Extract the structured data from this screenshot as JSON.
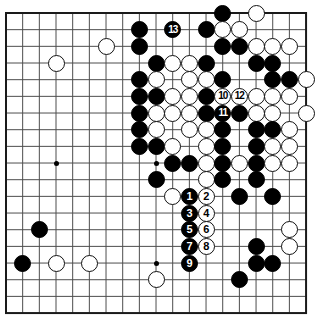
{
  "figure": {
    "kind": "go-board-diagram",
    "title": "",
    "board_size": 19,
    "colors": {
      "background": "#ffffff",
      "grid_line": "#4d4d4d",
      "border_line": "#1a1a1a",
      "black_stone": "#000000",
      "white_stone": "#ffffff",
      "white_stone_outline": "#111111"
    }
  },
  "geometry": {
    "origin_x": 6,
    "origin_y": 13,
    "spacing": 16.67,
    "stone_diameter": 17,
    "border_width": 2
  },
  "hoshi": [
    {
      "col": 3,
      "row": 3
    },
    {
      "col": 9,
      "row": 3
    },
    {
      "col": 15,
      "row": 3
    },
    {
      "col": 3,
      "row": 9
    },
    {
      "col": 9,
      "row": 9
    },
    {
      "col": 15,
      "row": 9
    },
    {
      "col": 3,
      "row": 15
    },
    {
      "col": 9,
      "row": 15
    },
    {
      "col": 15,
      "row": 15
    }
  ],
  "stones": [
    {
      "col": 13,
      "row": 0,
      "color": "black",
      "label": ""
    },
    {
      "col": 15,
      "row": 0,
      "color": "white",
      "label": ""
    },
    {
      "col": 8,
      "row": 1,
      "color": "black",
      "label": ""
    },
    {
      "col": 10,
      "row": 1,
      "color": "black",
      "label": "13"
    },
    {
      "col": 12,
      "row": 1,
      "color": "black",
      "label": ""
    },
    {
      "col": 13,
      "row": 1,
      "color": "white",
      "label": ""
    },
    {
      "col": 14,
      "row": 1,
      "color": "white",
      "label": ""
    },
    {
      "col": 6,
      "row": 2,
      "color": "white",
      "label": ""
    },
    {
      "col": 8,
      "row": 2,
      "color": "black",
      "label": ""
    },
    {
      "col": 13,
      "row": 2,
      "color": "black",
      "label": ""
    },
    {
      "col": 14,
      "row": 2,
      "color": "black",
      "label": ""
    },
    {
      "col": 15,
      "row": 2,
      "color": "white",
      "label": ""
    },
    {
      "col": 16,
      "row": 2,
      "color": "white",
      "label": ""
    },
    {
      "col": 17,
      "row": 2,
      "color": "white",
      "label": ""
    },
    {
      "col": 3,
      "row": 3,
      "color": "white",
      "label": ""
    },
    {
      "col": 9,
      "row": 3,
      "color": "black",
      "label": ""
    },
    {
      "col": 10,
      "row": 3,
      "color": "white",
      "label": ""
    },
    {
      "col": 11,
      "row": 3,
      "color": "white",
      "label": ""
    },
    {
      "col": 12,
      "row": 3,
      "color": "black",
      "label": ""
    },
    {
      "col": 15,
      "row": 3,
      "color": "black",
      "label": ""
    },
    {
      "col": 16,
      "row": 3,
      "color": "black",
      "label": ""
    },
    {
      "col": 8,
      "row": 4,
      "color": "black",
      "label": ""
    },
    {
      "col": 9,
      "row": 4,
      "color": "white",
      "label": ""
    },
    {
      "col": 11,
      "row": 4,
      "color": "white",
      "label": ""
    },
    {
      "col": 12,
      "row": 4,
      "color": "white",
      "label": ""
    },
    {
      "col": 13,
      "row": 4,
      "color": "black",
      "label": ""
    },
    {
      "col": 16,
      "row": 4,
      "color": "black",
      "label": ""
    },
    {
      "col": 17,
      "row": 4,
      "color": "black",
      "label": ""
    },
    {
      "col": 18,
      "row": 4,
      "color": "white",
      "label": ""
    },
    {
      "col": 8,
      "row": 5,
      "color": "black",
      "label": ""
    },
    {
      "col": 9,
      "row": 5,
      "color": "black",
      "label": ""
    },
    {
      "col": 10,
      "row": 5,
      "color": "white",
      "label": ""
    },
    {
      "col": 11,
      "row": 5,
      "color": "white",
      "label": ""
    },
    {
      "col": 12,
      "row": 5,
      "color": "black",
      "label": ""
    },
    {
      "col": 13,
      "row": 5,
      "color": "white",
      "label": "10"
    },
    {
      "col": 14,
      "row": 5,
      "color": "white",
      "label": "12"
    },
    {
      "col": 15,
      "row": 5,
      "color": "white",
      "label": ""
    },
    {
      "col": 16,
      "row": 5,
      "color": "white",
      "label": ""
    },
    {
      "col": 17,
      "row": 5,
      "color": "white",
      "label": ""
    },
    {
      "col": 8,
      "row": 6,
      "color": "black",
      "label": ""
    },
    {
      "col": 9,
      "row": 6,
      "color": "white",
      "label": ""
    },
    {
      "col": 10,
      "row": 6,
      "color": "white",
      "label": ""
    },
    {
      "col": 11,
      "row": 6,
      "color": "white",
      "label": ""
    },
    {
      "col": 12,
      "row": 6,
      "color": "black",
      "label": ""
    },
    {
      "col": 13,
      "row": 6,
      "color": "black",
      "label": "11"
    },
    {
      "col": 14,
      "row": 6,
      "color": "black",
      "label": ""
    },
    {
      "col": 15,
      "row": 6,
      "color": "white",
      "label": ""
    },
    {
      "col": 16,
      "row": 6,
      "color": "white",
      "label": ""
    },
    {
      "col": 18,
      "row": 6,
      "color": "white",
      "label": ""
    },
    {
      "col": 8,
      "row": 7,
      "color": "black",
      "label": ""
    },
    {
      "col": 9,
      "row": 7,
      "color": "white",
      "label": ""
    },
    {
      "col": 11,
      "row": 7,
      "color": "white",
      "label": ""
    },
    {
      "col": 12,
      "row": 7,
      "color": "white",
      "label": ""
    },
    {
      "col": 13,
      "row": 7,
      "color": "black",
      "label": ""
    },
    {
      "col": 15,
      "row": 7,
      "color": "black",
      "label": ""
    },
    {
      "col": 16,
      "row": 7,
      "color": "black",
      "label": ""
    },
    {
      "col": 17,
      "row": 7,
      "color": "white",
      "label": ""
    },
    {
      "col": 8,
      "row": 8,
      "color": "black",
      "label": ""
    },
    {
      "col": 9,
      "row": 8,
      "color": "black",
      "label": ""
    },
    {
      "col": 10,
      "row": 8,
      "color": "white",
      "label": ""
    },
    {
      "col": 12,
      "row": 8,
      "color": "white",
      "label": ""
    },
    {
      "col": 13,
      "row": 8,
      "color": "black",
      "label": ""
    },
    {
      "col": 15,
      "row": 8,
      "color": "black",
      "label": ""
    },
    {
      "col": 16,
      "row": 8,
      "color": "white",
      "label": ""
    },
    {
      "col": 17,
      "row": 8,
      "color": "white",
      "label": ""
    },
    {
      "col": 10,
      "row": 9,
      "color": "black",
      "label": ""
    },
    {
      "col": 11,
      "row": 9,
      "color": "black",
      "label": ""
    },
    {
      "col": 12,
      "row": 9,
      "color": "white",
      "label": ""
    },
    {
      "col": 13,
      "row": 9,
      "color": "black",
      "label": ""
    },
    {
      "col": 14,
      "row": 9,
      "color": "white",
      "label": ""
    },
    {
      "col": 15,
      "row": 9,
      "color": "black",
      "label": ""
    },
    {
      "col": 16,
      "row": 9,
      "color": "white",
      "label": ""
    },
    {
      "col": 17,
      "row": 9,
      "color": "white",
      "label": ""
    },
    {
      "col": 9,
      "row": 10,
      "color": "black",
      "label": ""
    },
    {
      "col": 12,
      "row": 10,
      "color": "white",
      "label": ""
    },
    {
      "col": 13,
      "row": 10,
      "color": "black",
      "label": ""
    },
    {
      "col": 15,
      "row": 10,
      "color": "black",
      "label": ""
    },
    {
      "col": 10,
      "row": 11,
      "color": "white",
      "label": ""
    },
    {
      "col": 11,
      "row": 11,
      "color": "black",
      "label": "1"
    },
    {
      "col": 12,
      "row": 11,
      "color": "white",
      "label": "2"
    },
    {
      "col": 14,
      "row": 11,
      "color": "black",
      "label": ""
    },
    {
      "col": 16,
      "row": 11,
      "color": "black",
      "label": ""
    },
    {
      "col": 11,
      "row": 12,
      "color": "black",
      "label": "3"
    },
    {
      "col": 12,
      "row": 12,
      "color": "white",
      "label": "4"
    },
    {
      "col": 2,
      "row": 13,
      "color": "black",
      "label": ""
    },
    {
      "col": 11,
      "row": 13,
      "color": "black",
      "label": "5"
    },
    {
      "col": 12,
      "row": 13,
      "color": "white",
      "label": "6"
    },
    {
      "col": 17,
      "row": 13,
      "color": "white",
      "label": ""
    },
    {
      "col": 11,
      "row": 14,
      "color": "black",
      "label": "7"
    },
    {
      "col": 12,
      "row": 14,
      "color": "white",
      "label": "8"
    },
    {
      "col": 15,
      "row": 14,
      "color": "black",
      "label": ""
    },
    {
      "col": 17,
      "row": 14,
      "color": "white",
      "label": ""
    },
    {
      "col": 1,
      "row": 15,
      "color": "black",
      "label": ""
    },
    {
      "col": 3,
      "row": 15,
      "color": "white",
      "label": ""
    },
    {
      "col": 5,
      "row": 15,
      "color": "white",
      "label": ""
    },
    {
      "col": 11,
      "row": 15,
      "color": "black",
      "label": "9"
    },
    {
      "col": 15,
      "row": 15,
      "color": "black",
      "label": ""
    },
    {
      "col": 16,
      "row": 15,
      "color": "black",
      "label": ""
    },
    {
      "col": 9,
      "row": 16,
      "color": "white",
      "label": ""
    },
    {
      "col": 14,
      "row": 16,
      "color": "black",
      "label": ""
    }
  ],
  "move_labels": [
    "1",
    "2",
    "3",
    "4",
    "5",
    "6",
    "7",
    "8",
    "9",
    "10",
    "11",
    "12",
    "13"
  ]
}
